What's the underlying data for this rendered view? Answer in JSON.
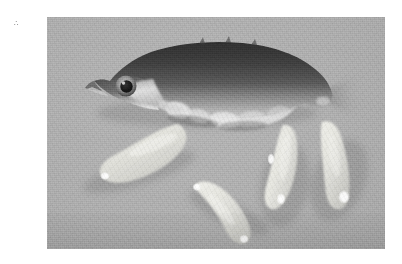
{
  "figure": {
    "domain_kind": "photograph",
    "corner_mark": "∴",
    "page_background": "#ffffff",
    "photo": {
      "x": 47,
      "y": 17,
      "width": 338,
      "height": 232,
      "background_color": "#ababab",
      "background_description": "uniform mid-grey matte board, faint scan grain",
      "medium": "black-and-white (greyscale) photographic print, scanned",
      "caption_text": "",
      "label_text": ""
    },
    "subjects": {
      "fish": {
        "label": "fish",
        "common_name": "three-spined stickleback",
        "orientation": "lateral view, head to the left, tail to the right",
        "condition": "ventrally distended / dissected abdomen",
        "dorsal_tone": "#3a3a3a",
        "ventral_tone": "#d8d8d8",
        "eye": {
          "iris_tone": "#9a9a9a",
          "pupil_tone": "#1e1e1e"
        }
      },
      "specimens": {
        "label": "excised parasite specimens",
        "common_name": "plerocercoid larvae",
        "count": 4,
        "tone": "#e2e2de",
        "highlight_tone": "#ffffff",
        "arrangement": "fanned out in a row beneath the fish",
        "items": [
          {
            "name": "specimen-1",
            "position": "left",
            "orientation": "angled down-left",
            "length_px": 122
          },
          {
            "name": "specimen-2",
            "position": "centre",
            "orientation": "angled down-right",
            "length_px": 100
          },
          {
            "name": "specimen-3",
            "position": "centre-right",
            "orientation": "near vertical",
            "length_px": 112
          },
          {
            "name": "specimen-4",
            "position": "right",
            "orientation": "angled down-right",
            "length_px": 118
          }
        ]
      }
    }
  }
}
